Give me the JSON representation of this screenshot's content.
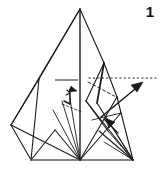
{
  "figure": {
    "step_label": "1",
    "caption": "",
    "type": "origami-folding-diagram",
    "canvas": {
      "width": 160,
      "height": 175
    },
    "colors": {
      "ink": "#1a1a1a",
      "ink_light": "#333333",
      "background": "#ffffff",
      "guide_gray": "#808080",
      "baseline_gray": "#6e6e6e"
    },
    "elements": {
      "apex_peak_label": "apex",
      "left_vertex_label": "left-corner",
      "bottom_center_label": "bottom-center",
      "bottom_right_label": "bottom-right",
      "dotted_guide_label": "horizontal-dotted-guide",
      "big_arrow_label": "fold-direction-arrow",
      "small_arrow_label": "small-fold-arrow",
      "curl_arrow_label": "curl-fold-arrow",
      "gray_mark_label": "gray-reference-line"
    },
    "geometry": {
      "apex": [
        80,
        9
      ],
      "left_corner": [
        11,
        125
      ],
      "bottom_left": [
        31,
        160
      ],
      "bottom_center": [
        80,
        160
      ],
      "bottom_right": [
        133,
        160
      ],
      "mid_left": [
        39,
        79
      ],
      "right_upper": [
        104,
        63
      ],
      "right_mid": [
        117,
        97
      ],
      "dotted_start": [
        88,
        78
      ],
      "dotted_end": [
        156,
        78
      ],
      "arrow_tail": [
        101,
        116
      ],
      "arrow_tip": [
        143,
        82
      ],
      "gray_line_start": [
        55,
        80
      ],
      "gray_line_end": [
        78,
        80
      ]
    }
  }
}
